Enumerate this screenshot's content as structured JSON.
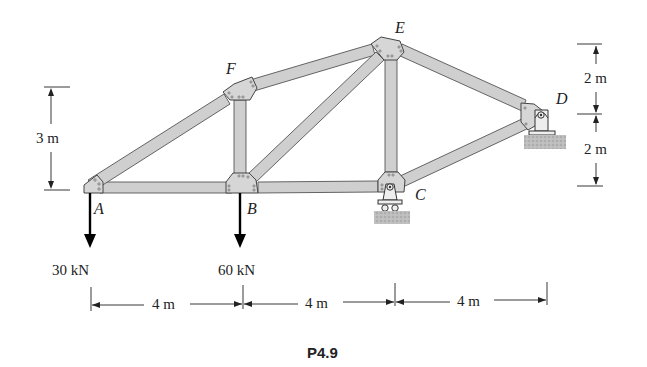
{
  "figure": {
    "caption": "P4.9",
    "type": "truss"
  },
  "joints": [
    {
      "id": "A",
      "label": "A",
      "x_m": 0,
      "y_m": 0
    },
    {
      "id": "B",
      "label": "B",
      "x_m": 4,
      "y_m": 0
    },
    {
      "id": "C",
      "label": "C",
      "x_m": 8,
      "y_m": 0
    },
    {
      "id": "D",
      "label": "D",
      "x_m": 12,
      "y_m": 2
    },
    {
      "id": "E",
      "label": "E",
      "x_m": 8,
      "y_m": 4
    },
    {
      "id": "F",
      "label": "F",
      "x_m": 4,
      "y_m": 3
    }
  ],
  "members": [
    "AB",
    "BC",
    "AF",
    "FE",
    "FB",
    "BE",
    "EC",
    "ED",
    "CD"
  ],
  "supports": [
    {
      "joint": "C",
      "type": "roller"
    },
    {
      "joint": "D",
      "type": "pin"
    }
  ],
  "loads": [
    {
      "joint": "A",
      "label": "30 kN",
      "direction": "down"
    },
    {
      "joint": "B",
      "label": "60 kN",
      "direction": "down"
    }
  ],
  "dimensions": {
    "left_height": "3 m",
    "right_upper": "2 m",
    "right_lower": "2 m",
    "spans": [
      "4 m",
      "4 m",
      "4 m"
    ]
  }
}
